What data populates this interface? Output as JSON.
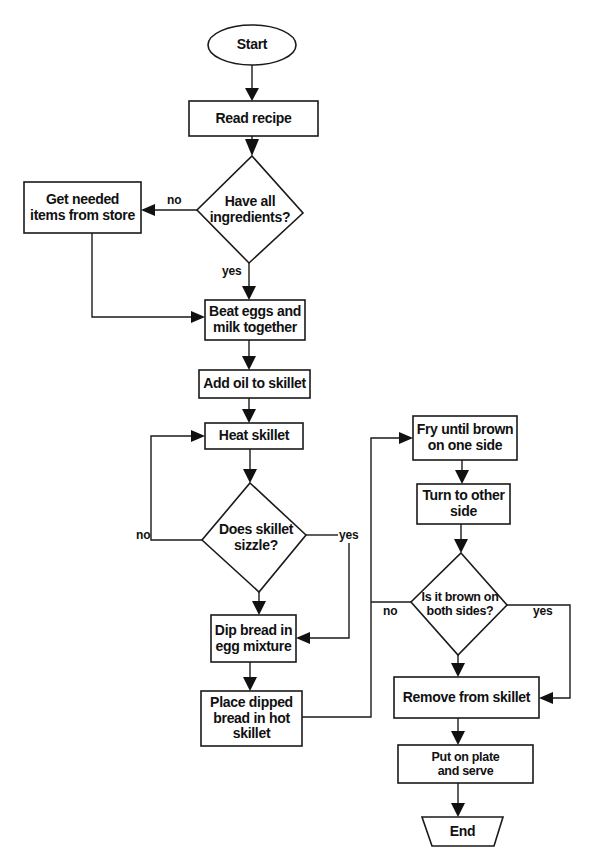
{
  "diagram": {
    "type": "flowchart",
    "colors": {
      "stroke": "#1a1a1a",
      "fill": "#ffffff",
      "text": "#111111"
    },
    "nodes": {
      "start": {
        "label": "Start",
        "shape": "oval"
      },
      "read_recipe": {
        "label": "Read recipe",
        "shape": "rect"
      },
      "have_ingredients": {
        "label": "Have all\ningredients?",
        "shape": "diamond"
      },
      "get_items": {
        "label": "Get needed\nitems from store",
        "shape": "rect"
      },
      "beat_eggs": {
        "label": "Beat eggs and\nmilk together",
        "shape": "rect"
      },
      "add_oil": {
        "label": "Add oil to skillet",
        "shape": "rect"
      },
      "heat_skillet": {
        "label": "Heat skillet",
        "shape": "rect"
      },
      "skillet_sizzle": {
        "label": "Does skillet\nsizzle?",
        "shape": "diamond"
      },
      "dip_bread": {
        "label": "Dip bread in\negg mixture",
        "shape": "rect"
      },
      "place_bread": {
        "label": "Place dipped\nbread in hot\nskillet",
        "shape": "rect"
      },
      "fry_brown": {
        "label": "Fry until brown\non one side",
        "shape": "rect"
      },
      "turn_side": {
        "label": "Turn to other\nside",
        "shape": "rect"
      },
      "brown_both": {
        "label": "Is it brown on\nboth sides?",
        "shape": "diamond"
      },
      "remove_skillet": {
        "label": "Remove from skillet",
        "shape": "rect"
      },
      "plate_serve": {
        "label": "Put on plate\nand serve",
        "shape": "rect"
      },
      "end": {
        "label": "End",
        "shape": "trapezoid"
      }
    },
    "edge_labels": {
      "ingredients_no": "no",
      "ingredients_yes": "yes",
      "sizzle_no": "no",
      "sizzle_yes": "yes",
      "brown_no": "no",
      "brown_yes": "yes"
    },
    "edges": [
      {
        "from": "start",
        "to": "read_recipe"
      },
      {
        "from": "read_recipe",
        "to": "have_ingredients"
      },
      {
        "from": "have_ingredients",
        "to": "get_items",
        "label": "no"
      },
      {
        "from": "have_ingredients",
        "to": "beat_eggs",
        "label": "yes"
      },
      {
        "from": "get_items",
        "to": "beat_eggs"
      },
      {
        "from": "beat_eggs",
        "to": "add_oil"
      },
      {
        "from": "add_oil",
        "to": "heat_skillet"
      },
      {
        "from": "heat_skillet",
        "to": "skillet_sizzle"
      },
      {
        "from": "skillet_sizzle",
        "to": "heat_skillet",
        "label": "no"
      },
      {
        "from": "skillet_sizzle",
        "to": "dip_bread",
        "label": "yes"
      },
      {
        "from": "skillet_sizzle",
        "to": "dip_bread"
      },
      {
        "from": "dip_bread",
        "to": "place_bread"
      },
      {
        "from": "place_bread",
        "to": "fry_brown"
      },
      {
        "from": "fry_brown",
        "to": "turn_side"
      },
      {
        "from": "turn_side",
        "to": "brown_both"
      },
      {
        "from": "brown_both",
        "to": "fry_brown",
        "label": "no"
      },
      {
        "from": "brown_both",
        "to": "remove_skillet",
        "label": "yes"
      },
      {
        "from": "brown_both",
        "to": "remove_skillet"
      },
      {
        "from": "remove_skillet",
        "to": "plate_serve"
      },
      {
        "from": "plate_serve",
        "to": "end"
      }
    ]
  }
}
